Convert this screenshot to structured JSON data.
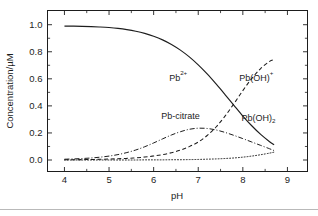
{
  "figure": {
    "background": "#ffffff",
    "ink_color": "#1d1d1d",
    "footer_rule_color": "#b9b9b9"
  },
  "chart_data": {
    "type": "line",
    "title": "",
    "xlabel": "pH",
    "ylabel": "Concentration/µM",
    "xlim": [
      3.62,
      9.45
    ],
    "ylim": [
      -0.085,
      1.105
    ],
    "grid": false,
    "legend": "inline-annotations",
    "xticks": [
      4,
      5,
      6,
      7,
      8,
      9
    ],
    "xtick_labels": [
      "4",
      "5",
      "6",
      "7",
      "8",
      "9"
    ],
    "xminor_ticks": [
      4.5,
      5.5,
      6.5,
      7.5,
      8.5
    ],
    "yticks": [
      0.0,
      0.2,
      0.4,
      0.6,
      0.8,
      1.0
    ],
    "ytick_labels": [
      "0.0",
      "0.2",
      "0.4",
      "0.6",
      "0.8",
      "1.0"
    ],
    "yminor_ticks": [
      0.1,
      0.3,
      0.5,
      0.7,
      0.9
    ],
    "x": [
      4.0,
      4.2,
      4.4,
      4.6,
      4.8,
      5.0,
      5.2,
      5.4,
      5.6,
      5.8,
      6.0,
      6.2,
      6.4,
      6.6,
      6.8,
      7.0,
      7.2,
      7.4,
      7.6,
      7.8,
      8.0,
      8.2,
      8.4,
      8.6,
      8.7
    ],
    "series": [
      {
        "name": "Pb2+",
        "label_html": "Pb<sup>2+</sup>",
        "linestyle": "solid",
        "values": [
          0.99,
          0.989,
          0.988,
          0.986,
          0.983,
          0.979,
          0.973,
          0.964,
          0.952,
          0.936,
          0.915,
          0.888,
          0.854,
          0.812,
          0.762,
          0.703,
          0.636,
          0.562,
          0.484,
          0.404,
          0.325,
          0.253,
          0.189,
          0.135,
          0.112
        ]
      },
      {
        "name": "Pb(OH)+",
        "label_html": "Pb(OH)<sup>+</sup>",
        "linestyle": "dashed",
        "values": [
          0.002,
          0.002,
          0.003,
          0.004,
          0.005,
          0.007,
          0.009,
          0.012,
          0.016,
          0.022,
          0.03,
          0.04,
          0.054,
          0.073,
          0.099,
          0.133,
          0.181,
          0.244,
          0.324,
          0.416,
          0.513,
          0.602,
          0.676,
          0.729,
          0.742
        ]
      },
      {
        "name": "Pb-citrate",
        "label_html": "Pb-citrate",
        "linestyle": "dashdot",
        "values": [
          0.006,
          0.008,
          0.011,
          0.015,
          0.021,
          0.029,
          0.04,
          0.055,
          0.074,
          0.098,
          0.126,
          0.156,
          0.185,
          0.209,
          0.227,
          0.235,
          0.233,
          0.222,
          0.204,
          0.182,
          0.158,
          0.133,
          0.108,
          0.083,
          0.07
        ]
      },
      {
        "name": "Pb(OH)2",
        "label_html": "Pb(OH)<sub>2</sub>",
        "linestyle": "dotted",
        "values": [
          0.0,
          0.0,
          0.0,
          0.0,
          0.0,
          0.0,
          0.0,
          0.0,
          0.0,
          0.001,
          0.001,
          0.001,
          0.002,
          0.002,
          0.003,
          0.004,
          0.006,
          0.008,
          0.011,
          0.015,
          0.021,
          0.029,
          0.039,
          0.051,
          0.058
        ]
      }
    ],
    "annotations": [
      {
        "name": "label-pb2plus",
        "text": "Pb",
        "sup": "2+",
        "sub": "",
        "x": 6.55,
        "y": 0.585
      },
      {
        "name": "label-pboh-plus",
        "text": "Pb(OH)",
        "sup": "+",
        "sub": "",
        "x": 8.3,
        "y": 0.585
      },
      {
        "name": "label-pb-citrate",
        "text": "Pb-citrate",
        "sup": "",
        "sub": "",
        "x": 6.6,
        "y": 0.3
      },
      {
        "name": "label-pboh2",
        "text": "Pb(OH)",
        "sup": "",
        "sub": "2",
        "x": 8.35,
        "y": 0.29
      }
    ]
  }
}
